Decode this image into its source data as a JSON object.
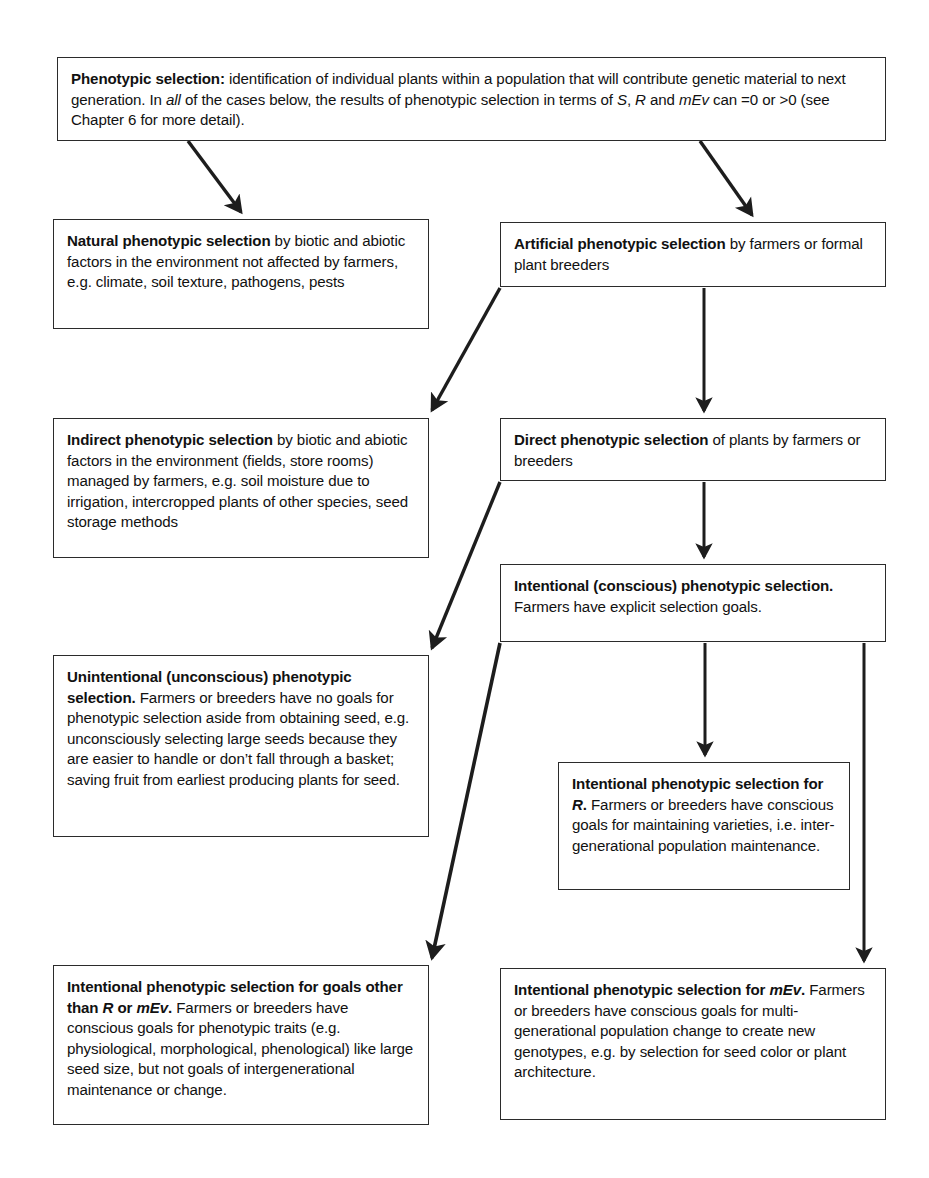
{
  "diagram": {
    "line_color": "#2b2b2b",
    "background": "#ffffff",
    "text_color": "#111111"
  },
  "nodes": {
    "root": {
      "name": "phenotypic-selection",
      "lead": "Phenotypic selection:",
      "body_1": " identification of individual plants within a population that will contribute genetic material to next generation. In ",
      "em_1": "all",
      "body_2": " of the cases below, the results of phenotypic selection in terms of ",
      "em_2": "S",
      "body_3": ", ",
      "em_3": "R",
      "body_4": " and ",
      "em_4": "mEv",
      "body_5": " can =0 or >0 (see Chapter 6 for more detail)."
    },
    "natural": {
      "name": "natural-phenotypic-selection",
      "lead": "Natural phenotypic selection",
      "body": " by biotic and abiotic factors in the environment not affected by farmers, e.g. climate, soil texture, pathogens, pests"
    },
    "artificial": {
      "name": "artificial-phenotypic-selection",
      "lead": "Artificial phenotypic selection",
      "body": " by farmers or formal plant breeders"
    },
    "indirect": {
      "name": "indirect-phenotypic-selection",
      "lead": "Indirect phenotypic selection",
      "body": " by biotic and abiotic factors in the environment (fields, store rooms) managed by farmers, e.g. soil moisture due to irrigation, intercropped plants of other species, seed storage methods"
    },
    "direct": {
      "name": "direct-phenotypic-selection",
      "lead": "Direct phenotypic selection",
      "body": " of plants by farmers or breeders"
    },
    "conscious": {
      "name": "intentional-conscious-phenotypic-selection",
      "lead": "Intentional (conscious) phenotypic selection.",
      "body": " Farmers have explicit selection goals."
    },
    "unconscious": {
      "name": "unintentional-unconscious-phenotypic-selection",
      "lead": "Unintentional (unconscious) phenotypic selection.",
      "body": " Farmers or breeders have no goals for phenotypic selection aside from obtaining seed, e.g. unconsciously selecting large seeds because they are easier to handle or don’t fall through a basket; saving fruit from earliest producing plants for seed."
    },
    "for_r": {
      "name": "intentional-phenotypic-selection-for-r",
      "lead_1": "Intentional phenotypic selection for ",
      "em_1": "R",
      "lead_2": ".",
      "body": " Farmers or breeders have conscious goals for maintaining varieties, i.e. inter-generational population maintenance."
    },
    "other_goals": {
      "name": "intentional-phenotypic-selection-other-goals",
      "lead_1": "Intentional phenotypic selection for goals other than ",
      "em_1": "R",
      "lead_2": " or ",
      "em_2": "mEv",
      "lead_3": ".",
      "body": " Farmers or breeders have conscious goals for phenotypic traits (e.g. physiological, morphological, phenological) like large seed size, but not goals of intergenerational maintenance or change."
    },
    "for_mev": {
      "name": "intentional-phenotypic-selection-for-mev",
      "lead_1": "Intentional phenotypic selection for ",
      "em_1": "mEv",
      "lead_2": ".",
      "body": " Farmers or breeders have conscious goals for multi-generational population change to create new genotypes, e.g. by selection for seed color or plant architecture."
    }
  },
  "edges": [
    {
      "name": "edge-root-to-natural",
      "from": "root",
      "to": "natural",
      "style": "diagonal"
    },
    {
      "name": "edge-root-to-artificial",
      "from": "root",
      "to": "artificial",
      "style": "diagonal"
    },
    {
      "name": "edge-artificial-to-indirect",
      "from": "artificial",
      "to": "indirect",
      "style": "diagonal"
    },
    {
      "name": "edge-artificial-to-direct",
      "from": "artificial",
      "to": "direct",
      "style": "vertical"
    },
    {
      "name": "edge-direct-to-unconscious",
      "from": "direct",
      "to": "unconscious",
      "style": "diagonal"
    },
    {
      "name": "edge-direct-to-conscious",
      "from": "direct",
      "to": "conscious",
      "style": "vertical"
    },
    {
      "name": "edge-conscious-to-other-goals",
      "from": "conscious",
      "to": "other_goals",
      "style": "diagonal"
    },
    {
      "name": "edge-conscious-to-for-r",
      "from": "conscious",
      "to": "for_r",
      "style": "vertical"
    },
    {
      "name": "edge-conscious-to-for-mev",
      "from": "conscious",
      "to": "for_mev",
      "style": "vertical"
    }
  ]
}
